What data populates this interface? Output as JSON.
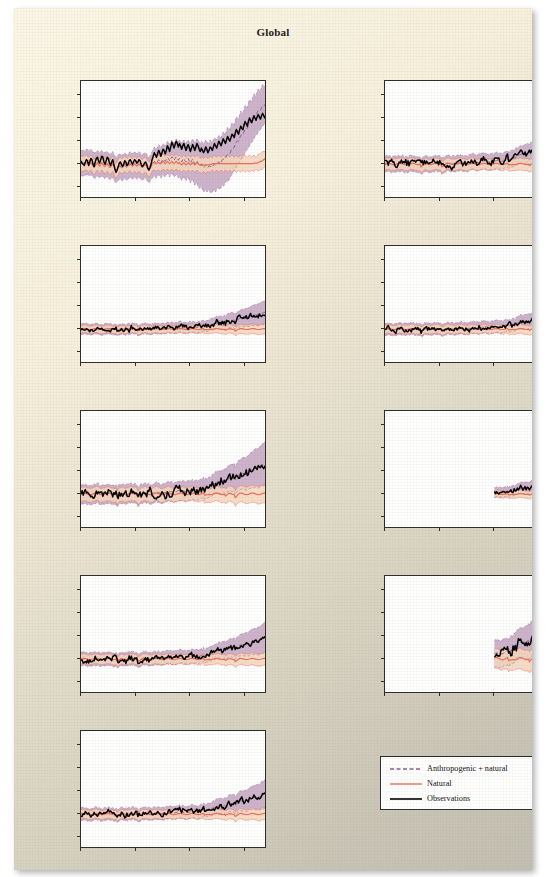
{
  "figure": {
    "title": "Global",
    "y_axis_label": "Change in temperature (°C)",
    "y_ticks": [
      "3.0",
      "2.0",
      "1.0",
      "0.0",
      "−1.0"
    ],
    "x_ticks": [
      "1850",
      "1900",
      "1950",
      "2000"
    ]
  },
  "legend": {
    "items": [
      {
        "label": "Anthropogenic + natural",
        "style": "dashed",
        "color": "#8c5f8c"
      },
      {
        "label": "Natural",
        "style": "solid",
        "color": "#e8705a"
      },
      {
        "label": "Observations",
        "style": "solid",
        "color": "#000000"
      }
    ]
  },
  "colors": {
    "anthropogenic_band": "#c4a6c2",
    "anthropogenic_line": "#8c5f8c",
    "natural_band": "#f6d7be",
    "natural_line": "#e8705a",
    "observations_line": "#000000",
    "page_background": "#f1ead6",
    "plot_background": "#ffffff",
    "axis": "#2b2b2b"
  },
  "chart_data": {
    "type": "line",
    "title": "Global",
    "xlabel": "",
    "ylabel": "Change in temperature (°C)",
    "xlim": [
      1850,
      2020
    ],
    "ylim": [
      -1.5,
      3.6
    ],
    "grid": false,
    "legend_position": "bottom-right",
    "x_tick_values": [
      1850,
      1900,
      1950,
      2000
    ],
    "y_tick_values": [
      -1.0,
      0.0,
      1.0,
      2.0,
      3.0
    ],
    "series_names": [
      "Observations",
      "Anthropogenic + natural",
      "Natural"
    ],
    "panels": [
      {
        "name": "North America",
        "x_start": 1850,
        "observations": [
          0.15,
          0.05,
          0.0,
          -0.05,
          0.1,
          0.2,
          0.15,
          -0.05,
          0.1,
          0.25,
          0.2,
          0.0,
          -0.1,
          0.1,
          0.25,
          0.3,
          0.15,
          0.05,
          0.2,
          0.35,
          0.3,
          0.1,
          0.0,
          0.15,
          0.3,
          0.25,
          0.05,
          -0.05,
          0.1,
          0.2,
          0.0,
          -0.2,
          -0.35,
          -0.25,
          -0.1,
          0.05,
          0.1,
          0.0,
          -0.1,
          0.0,
          0.15,
          0.1,
          -0.05,
          0.0,
          0.15,
          0.2,
          0.1,
          0.0,
          0.1,
          0.2,
          0.15,
          0.05,
          0.1,
          0.2,
          0.15,
          0.0,
          -0.1,
          -0.05,
          0.05,
          0.1,
          0.0,
          -0.15,
          -0.25,
          -0.15,
          0.0,
          0.2,
          0.35,
          0.5,
          0.4,
          0.3,
          0.45,
          0.6,
          0.5,
          0.35,
          0.5,
          0.65,
          0.6,
          0.45,
          0.6,
          0.8,
          0.7,
          0.55,
          0.75,
          0.95,
          0.85,
          0.7,
          0.85,
          1.0,
          0.9,
          0.75,
          0.9,
          0.8,
          0.65,
          0.8,
          0.9,
          0.75,
          0.6,
          0.75,
          0.85,
          0.7,
          0.55,
          0.7,
          0.85,
          0.75,
          0.6,
          0.75,
          0.9,
          0.8,
          0.65,
          0.55,
          0.7,
          0.6,
          0.5,
          0.6,
          0.75,
          0.65,
          0.5,
          0.6,
          0.75,
          0.7,
          0.6,
          0.75,
          0.9,
          0.8,
          0.7,
          0.85,
          1.0,
          0.9,
          0.8,
          0.95,
          1.1,
          1.0,
          0.9,
          1.05,
          1.2,
          1.1,
          1.0,
          1.15,
          1.3,
          1.25,
          1.15,
          1.35,
          1.5,
          1.4,
          1.3,
          1.5,
          1.65,
          1.55,
          1.5,
          1.7,
          1.85,
          1.75,
          1.65,
          1.85,
          2.0,
          1.9,
          1.8,
          1.95,
          2.1,
          2.0,
          1.9,
          2.05,
          2.15,
          2.05,
          1.95,
          2.1,
          2.2,
          2.1,
          2.0,
          2.15,
          2.0
        ],
        "anthropogenic_upper": [
          0.6,
          0.6,
          0.6,
          0.6,
          0.6,
          0.65,
          0.65,
          0.6,
          0.6,
          0.65,
          0.6,
          0.55,
          0.5,
          0.5,
          0.55,
          0.6,
          0.55,
          0.5,
          0.55,
          0.6,
          0.55,
          0.5,
          0.5,
          0.55,
          0.55,
          0.5,
          0.45,
          0.45,
          0.5,
          0.55,
          0.45,
          0.35,
          0.3,
          0.35,
          0.4,
          0.45,
          0.45,
          0.4,
          0.4,
          0.45,
          0.5,
          0.45,
          0.4,
          0.45,
          0.5,
          0.55,
          0.5,
          0.45,
          0.5,
          0.55,
          0.5,
          0.45,
          0.5,
          0.55,
          0.5,
          0.45,
          0.4,
          0.45,
          0.5,
          0.5,
          0.45,
          0.35,
          0.3,
          0.35,
          0.45,
          0.55,
          0.65,
          0.75,
          0.7,
          0.65,
          0.75,
          0.85,
          0.8,
          0.7,
          0.8,
          0.9,
          0.85,
          0.8,
          0.9,
          1.0,
          0.95,
          0.85,
          0.95,
          1.05,
          1.0,
          0.9,
          1.0,
          1.1,
          1.05,
          0.95,
          1.05,
          1.0,
          0.9,
          1.0,
          1.05,
          0.95,
          0.9,
          1.0,
          1.05,
          0.95,
          0.9,
          1.0,
          1.1,
          1.0,
          0.95,
          1.0,
          1.1,
          1.05,
          0.95,
          0.9,
          1.0,
          0.95,
          0.9,
          0.95,
          1.05,
          1.0,
          0.9,
          0.95,
          1.05,
          1.0,
          0.95,
          1.05,
          1.15,
          1.1,
          1.05,
          1.15,
          1.25,
          1.2,
          1.15,
          1.25,
          1.4,
          1.35,
          1.3,
          1.45,
          1.6,
          1.55,
          1.5,
          1.65,
          1.8,
          1.75,
          1.7,
          1.9,
          2.05,
          2.0,
          1.95,
          2.15,
          2.3,
          2.25,
          2.2,
          2.4,
          2.55,
          2.5,
          2.45,
          2.65,
          2.8,
          2.75,
          2.7,
          2.9,
          3.05,
          3.0,
          2.95,
          3.15,
          3.25,
          3.2,
          3.15,
          3.35,
          3.45,
          3.4,
          3.35,
          3.5,
          3.6
        ],
        "anthropogenic_lower": [
          -0.5,
          -0.5,
          -0.5,
          -0.5,
          -0.5,
          -0.45,
          -0.45,
          -0.5,
          -0.5,
          -0.45,
          -0.5,
          -0.55,
          -0.6,
          -0.6,
          -0.55,
          -0.5,
          -0.55,
          -0.6,
          -0.55,
          -0.5,
          -0.55,
          -0.6,
          -0.6,
          -0.55,
          -0.55,
          -0.6,
          -0.65,
          -0.65,
          -0.6,
          -0.55,
          -0.65,
          -0.75,
          -0.8,
          -0.75,
          -0.7,
          -0.65,
          -0.65,
          -0.7,
          -0.7,
          -0.65,
          -0.6,
          -0.65,
          -0.7,
          -0.65,
          -0.6,
          -0.55,
          -0.6,
          -0.65,
          -0.6,
          -0.55,
          -0.6,
          -0.65,
          -0.6,
          -0.55,
          -0.6,
          -0.65,
          -0.7,
          -0.65,
          -0.6,
          -0.6,
          -0.65,
          -0.75,
          -0.8,
          -0.75,
          -0.65,
          -0.6,
          -0.55,
          -0.5,
          -0.55,
          -0.6,
          -0.5,
          -0.45,
          -0.5,
          -0.6,
          -0.5,
          -0.45,
          -0.5,
          -0.55,
          -0.45,
          -0.4,
          -0.45,
          -0.55,
          -0.45,
          -0.4,
          -0.45,
          -0.55,
          -0.5,
          -0.45,
          -0.5,
          -0.6,
          -0.55,
          -0.6,
          -0.7,
          -0.6,
          -0.55,
          -0.65,
          -0.7,
          -0.6,
          -0.55,
          -0.7,
          -0.8,
          -0.7,
          -0.65,
          -0.8,
          -0.9,
          -0.85,
          -0.8,
          -0.95,
          -1.05,
          -1.0,
          -0.95,
          -1.1,
          -1.2,
          -1.15,
          -1.1,
          -1.2,
          -1.15,
          -1.1,
          -1.2,
          -1.25,
          -1.2,
          -1.1,
          -1.15,
          -1.2,
          -1.1,
          -1.0,
          -1.05,
          -1.1,
          -1.0,
          -0.9,
          -0.95,
          -0.9,
          -0.8,
          -0.7,
          -0.75,
          -0.7,
          -0.6,
          -0.5,
          -0.45,
          -0.35,
          -0.25,
          -0.2,
          -0.1,
          0.0,
          0.05,
          0.1,
          0.2,
          0.3,
          0.35,
          0.4,
          0.5,
          0.6,
          0.65,
          0.7,
          0.8,
          0.9,
          0.95,
          1.0,
          1.1,
          1.2,
          1.25,
          1.3,
          1.4,
          1.45,
          1.5,
          1.55,
          1.65,
          1.7,
          1.75,
          1.8,
          1.9,
          2.0
        ],
        "natural_upper": [
          0.35,
          0.35,
          0.35,
          0.35,
          0.4,
          0.4,
          0.35,
          0.3,
          0.35,
          0.4,
          0.35,
          0.25,
          0.2,
          0.25,
          0.35,
          0.4,
          0.3,
          0.25,
          0.3,
          0.4,
          0.35,
          0.25,
          0.25,
          0.3,
          0.35,
          0.3,
          0.2,
          0.2,
          0.3,
          0.35,
          0.25,
          0.1,
          0.05,
          0.1,
          0.2,
          0.3,
          0.3,
          0.25,
          0.25,
          0.3,
          0.35,
          0.3,
          0.25,
          0.3,
          0.35,
          0.35,
          0.3,
          0.25,
          0.3,
          0.35,
          0.3,
          0.25,
          0.3,
          0.35,
          0.3,
          0.25,
          0.2,
          0.25,
          0.3,
          0.3,
          0.25,
          0.15,
          0.1,
          0.15,
          0.25,
          0.35,
          0.4,
          0.4,
          0.35,
          0.35,
          0.4,
          0.4,
          0.35,
          0.35,
          0.4,
          0.45,
          0.4,
          0.35,
          0.4,
          0.45,
          0.4,
          0.35,
          0.4,
          0.45,
          0.4,
          0.35,
          0.4,
          0.45,
          0.4,
          0.35,
          0.4,
          0.35,
          0.3,
          0.35,
          0.4,
          0.35,
          0.3,
          0.35,
          0.4,
          0.35,
          0.3,
          0.35,
          0.4,
          0.35,
          0.3,
          0.35,
          0.4,
          0.35,
          0.3,
          0.25,
          0.3,
          0.3,
          0.25,
          0.3,
          0.35,
          0.3,
          0.25,
          0.3,
          0.35,
          0.3,
          0.3,
          0.35,
          0.4,
          0.35,
          0.3,
          0.35,
          0.4,
          0.35,
          0.3,
          0.35,
          0.4,
          0.35,
          0.3,
          0.35,
          0.4,
          0.35,
          0.3,
          0.35,
          0.4,
          0.35,
          0.3,
          0.35,
          0.4,
          0.35,
          0.3,
          0.35,
          0.4,
          0.35,
          0.3,
          0.35,
          0.4,
          0.35,
          0.3,
          0.35,
          0.4,
          0.35,
          0.3,
          0.35,
          0.4,
          0.35,
          0.3,
          0.35,
          0.45,
          0.45,
          0.45,
          0.5,
          0.55,
          0.55,
          0.55,
          0.6,
          0.7,
          0.75,
          0.8,
          0.9,
          1.0
        ],
        "natural_lower": [
          -0.3,
          -0.3,
          -0.3,
          -0.3,
          -0.25,
          -0.25,
          -0.3,
          -0.35,
          -0.3,
          -0.25,
          -0.3,
          -0.4,
          -0.45,
          -0.4,
          -0.3,
          -0.25,
          -0.35,
          -0.4,
          -0.35,
          -0.25,
          -0.3,
          -0.4,
          -0.4,
          -0.35,
          -0.3,
          -0.35,
          -0.45,
          -0.45,
          -0.35,
          -0.3,
          -0.4,
          -0.55,
          -0.6,
          -0.55,
          -0.45,
          -0.35,
          -0.35,
          -0.4,
          -0.4,
          -0.35,
          -0.3,
          -0.35,
          -0.4,
          -0.35,
          -0.3,
          -0.3,
          -0.35,
          -0.4,
          -0.35,
          -0.3,
          -0.35,
          -0.4,
          -0.35,
          -0.3,
          -0.35,
          -0.4,
          -0.45,
          -0.4,
          -0.35,
          -0.35,
          -0.4,
          -0.5,
          -0.55,
          -0.5,
          -0.4,
          -0.3,
          -0.25,
          -0.25,
          -0.3,
          -0.3,
          -0.25,
          -0.25,
          -0.3,
          -0.3,
          -0.25,
          -0.2,
          -0.25,
          -0.3,
          -0.25,
          -0.2,
          -0.25,
          -0.3,
          -0.25,
          -0.2,
          -0.25,
          -0.3,
          -0.25,
          -0.2,
          -0.25,
          -0.3,
          -0.25,
          -0.3,
          -0.35,
          -0.3,
          -0.25,
          -0.3,
          -0.35,
          -0.3,
          -0.25,
          -0.3,
          -0.35,
          -0.3,
          -0.25,
          -0.3,
          -0.35,
          -0.3,
          -0.25,
          -0.3,
          -0.35,
          -0.35,
          -0.4,
          -0.35,
          -0.3,
          -0.35,
          -0.4,
          -0.35,
          -0.3,
          -0.35,
          -0.35,
          -0.3,
          -0.25,
          -0.3,
          -0.35,
          -0.3,
          -0.25,
          -0.3,
          -0.35,
          -0.3,
          -0.25,
          -0.3,
          -0.35,
          -0.3,
          -0.25,
          -0.3,
          -0.35,
          -0.3,
          -0.25,
          -0.3,
          -0.35,
          -0.3,
          -0.25,
          -0.3,
          -0.35,
          -0.3,
          -0.25,
          -0.3,
          -0.35,
          -0.3,
          -0.25,
          -0.3,
          -0.35,
          -0.3,
          -0.25,
          -0.3,
          -0.35,
          -0.3,
          -0.25,
          -0.3,
          -0.3,
          -0.25,
          -0.2,
          -0.25,
          -0.3,
          -0.25,
          -0.2,
          -0.25,
          -0.2,
          -0.15,
          -0.1,
          -0.05,
          0.0
        ]
      },
      {
        "name": "Asia",
        "x_start": 1850,
        "scale": 0.82,
        "shape": "asia"
      },
      {
        "name": "Central and South America",
        "x_start": 1850,
        "scale": 0.55,
        "shape": "csa"
      },
      {
        "name": "Australasia",
        "x_start": 1850,
        "scale": 0.62,
        "shape": "aus"
      },
      {
        "name": "Europe and North Africa",
        "x_start": 1850,
        "scale": 1.0,
        "shape": "eur"
      },
      {
        "name": "Antarctic",
        "x_start": 1950,
        "scale": 0.5,
        "shape": "ant"
      },
      {
        "name": "Africa",
        "x_start": 1850,
        "scale": 0.7,
        "shape": "afr"
      },
      {
        "name": "Arctic",
        "x_start": 1950,
        "scale": 1.4,
        "shape": "arc"
      },
      {
        "name": "Near-surface air temperature",
        "x_start": 1850,
        "scale": 0.65,
        "shape": "glob"
      }
    ]
  },
  "panels": [
    {
      "title": "North America",
      "row": 0,
      "col": 0
    },
    {
      "title": "Asia",
      "row": 0,
      "col": 1
    },
    {
      "title": "Central and South America",
      "row": 1,
      "col": 0
    },
    {
      "title": "Australasia",
      "row": 1,
      "col": 1
    },
    {
      "title": "Europe and North Africa",
      "row": 2,
      "col": 0
    },
    {
      "title": "Antarctic",
      "row": 2,
      "col": 1
    },
    {
      "title": "Africa",
      "row": 3,
      "col": 0
    },
    {
      "title": "Arctic",
      "row": 3,
      "col": 1
    },
    {
      "title": "Near-surface air temperature",
      "row": 4,
      "col": 0
    }
  ]
}
